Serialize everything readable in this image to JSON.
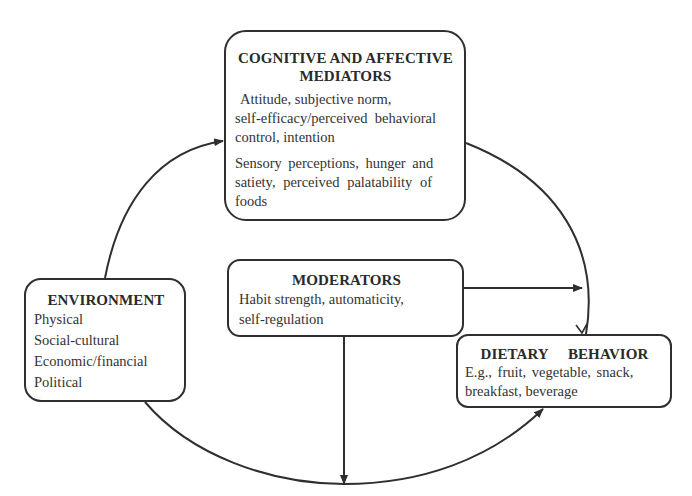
{
  "diagram": {
    "type": "conceptual-model",
    "line_color": "#2f2f2f",
    "background": "#ffffff"
  },
  "cognitive_mediators": {
    "title_line1": "COGNITIVE AND AFFECTIVE",
    "title_line2": "MEDIATORS",
    "para1_line1": "Attitude, subjective norm,",
    "para1_line2": "self-efficacy/perceived  behavioral",
    "para1_line3": "control, intention",
    "para2_line1": "Sensory perceptions, hunger and",
    "para2_line2": "satiety, perceived palatability of",
    "para2_line3": "foods"
  },
  "moderators": {
    "title": "MODERATORS",
    "line1": "Habit strength, automaticity,",
    "line2": "self-regulation"
  },
  "environment": {
    "title": "ENVIRONMENT",
    "items": [
      "Physical",
      "Social-cultural",
      "Economic/financial",
      "Political"
    ]
  },
  "dietary_behavior": {
    "title": "DIETARY  BEHAVIOR",
    "line1": "E.g., fruit, vegetable, snack,",
    "line2": "breakfast, beverage"
  },
  "connections": [
    {
      "from": "environment",
      "to": "cognitive_mediators",
      "style": "curved-arrow"
    },
    {
      "from": "cognitive_mediators",
      "to": "dietary_behavior",
      "style": "curved-arrow"
    },
    {
      "from": "environment",
      "to": "dietary_behavior",
      "style": "curved-arrow"
    },
    {
      "from": "moderators",
      "to": "mediators-to-behavior-path",
      "style": "straight-arrow"
    },
    {
      "from": "moderators",
      "to": "environment-to-behavior-path",
      "style": "straight-arrow"
    }
  ]
}
